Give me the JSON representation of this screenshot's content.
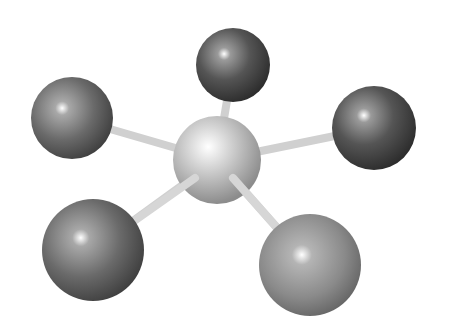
{
  "figure": {
    "background": "#ffffff",
    "central_atom": {
      "cx": 217,
      "cy": 160,
      "r": 44,
      "color": "#b8b8b8"
    },
    "ligands": [
      {
        "name": "top",
        "cx": 233,
        "cy": 65,
        "r": 37,
        "color": "#5a5a5a"
      },
      {
        "name": "left",
        "cx": 72,
        "cy": 118,
        "r": 41,
        "color": "#6a6a6a"
      },
      {
        "name": "right",
        "cx": 374,
        "cy": 128,
        "r": 42,
        "color": "#4a4a4a"
      },
      {
        "name": "bottom-left",
        "cx": 93,
        "cy": 250,
        "r": 51,
        "color": "#6a6a6a"
      },
      {
        "name": "bottom-right",
        "cx": 310,
        "cy": 265,
        "r": 51,
        "color": "#8a8a8a"
      }
    ],
    "bond_color": "#d4d4d4"
  }
}
